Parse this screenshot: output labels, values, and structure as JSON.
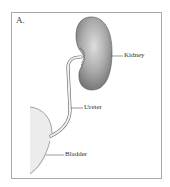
{
  "figure": {
    "panel_label": "A.",
    "labels": {
      "kidney": "Kidney",
      "ureter": "Ureter",
      "bladder": "Bladder"
    }
  },
  "colors": {
    "border": "#a8a8a8",
    "kidney_fill": "#8e8e8e",
    "kidney_highlight": "#d6d6d6",
    "bladder_fill": "#ececec",
    "line": "#555555",
    "text": "#333333"
  }
}
